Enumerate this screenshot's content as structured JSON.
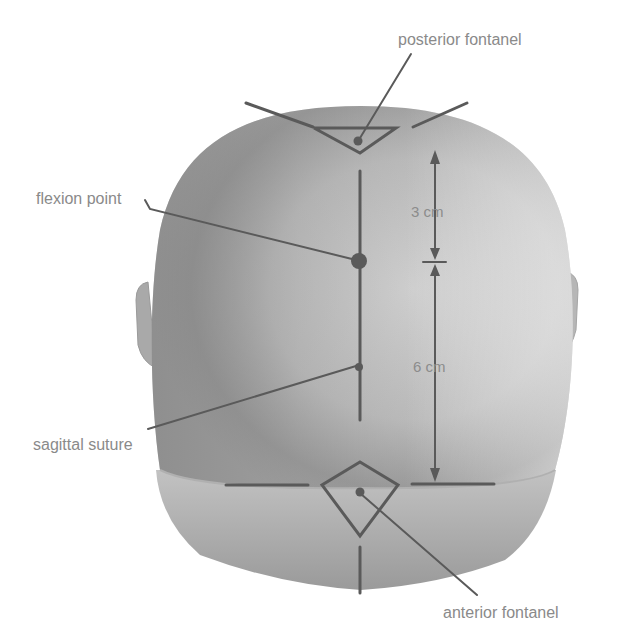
{
  "diagram": {
    "labels": {
      "posterior_fontanel": "posterior fontanel",
      "flexion_point": "flexion point",
      "sagittal_suture": "sagittal suture",
      "anterior_fontanel": "anterior fontanel"
    },
    "measurements": {
      "upper": "3 cm",
      "lower": "6 cm"
    },
    "colors": {
      "background": "#ffffff",
      "head_light": "#d8d8d8",
      "head_dark": "#8e8e8e",
      "lines": "#5a5a5a",
      "label_text": "#8a8a8a"
    }
  }
}
